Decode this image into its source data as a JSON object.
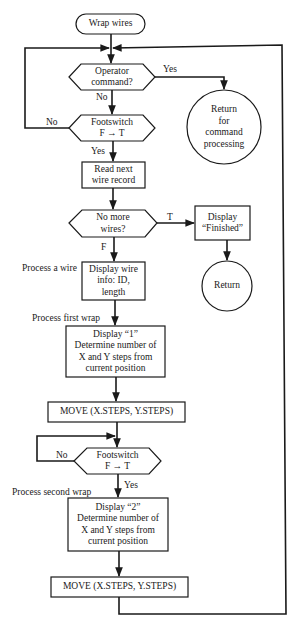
{
  "diagram": {
    "type": "flowchart",
    "nodes": {
      "start": {
        "kind": "terminal",
        "text": "Wrap wires"
      },
      "operator_command": {
        "kind": "decision",
        "text": "Operator\ncommand?"
      },
      "footswitch_1": {
        "kind": "decision",
        "text": "Footswitch\nF → T"
      },
      "return_cmd": {
        "kind": "connector-circle",
        "text": "Return\nfor\ncommand\nprocessing"
      },
      "read_next": {
        "kind": "process",
        "text": "Read next\nwire record"
      },
      "no_more_wires": {
        "kind": "decision",
        "text": "No more\nwires?"
      },
      "display_finished": {
        "kind": "process",
        "text": "Display\n“Finished”"
      },
      "return_end": {
        "kind": "connector-circle",
        "text": "Return"
      },
      "display_wire_info": {
        "kind": "process",
        "text": "Display wire\ninfo: ID,\nlength"
      },
      "display_1": {
        "kind": "process",
        "text": "Display “1”\nDetermine number of\nX  and Y steps from\ncurrent position"
      },
      "move_1": {
        "kind": "process",
        "text": "MOVE (X.STEPS, Y.STEPS)"
      },
      "footswitch_2": {
        "kind": "decision",
        "text": "Footswitch\nF → T"
      },
      "display_2": {
        "kind": "process",
        "text": "Display “2”\nDetermine number of\nX and Y steps from\ncurrent position"
      },
      "move_2": {
        "kind": "process",
        "text": "MOVE (X.STEPS, Y.STEPS)"
      }
    },
    "edge_labels": {
      "operator_yes": "Yes",
      "operator_no": "No",
      "footswitch1_no": "No",
      "footswitch1_yes": "Yes",
      "nomore_true": "T",
      "nomore_false": "F",
      "footswitch2_no": "No",
      "footswitch2_yes": "Yes"
    },
    "annotations": {
      "process_wire": "Process a wire",
      "process_first_wrap": "Process first wrap",
      "process_second_wrap": "Process second wrap"
    },
    "edges": [
      [
        "start",
        "operator_command"
      ],
      [
        "operator_command",
        "return_cmd",
        "Yes"
      ],
      [
        "operator_command",
        "footswitch_1",
        "No"
      ],
      [
        "footswitch_1",
        "operator_command",
        "No"
      ],
      [
        "footswitch_1",
        "read_next",
        "Yes"
      ],
      [
        "read_next",
        "no_more_wires"
      ],
      [
        "no_more_wires",
        "display_finished",
        "T"
      ],
      [
        "display_finished",
        "return_end"
      ],
      [
        "no_more_wires",
        "display_wire_info",
        "F"
      ],
      [
        "display_wire_info",
        "display_1"
      ],
      [
        "display_1",
        "move_1"
      ],
      [
        "move_1",
        "footswitch_2"
      ],
      [
        "footswitch_2",
        "footswitch_2",
        "No"
      ],
      [
        "footswitch_2",
        "display_2",
        "Yes"
      ],
      [
        "display_2",
        "move_2"
      ],
      [
        "move_2",
        "operator_command"
      ]
    ],
    "colors": {
      "ink": "#1a1a1a",
      "background": "#ffffff"
    }
  }
}
